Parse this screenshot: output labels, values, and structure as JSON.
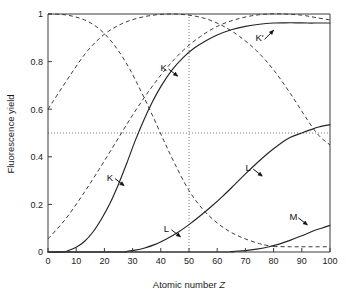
{
  "chart_data": {
    "type": "line",
    "title": "",
    "xlabel": "Atomic number Z",
    "xlabel_plain": "Atomic number",
    "xlabel_italic": "Z",
    "ylabel": "Fluorescence yield",
    "xlim": [
      0,
      100
    ],
    "ylim": [
      0,
      1
    ],
    "grid": false,
    "legend_position": "inline-annotations",
    "xticks": [
      "0",
      "10",
      "20",
      "30",
      "40",
      "50",
      "60",
      "70",
      "80",
      "90",
      "100"
    ],
    "xtick_values": [
      0,
      10,
      20,
      30,
      40,
      50,
      60,
      70,
      80,
      90,
      100
    ],
    "yticks": [
      "0",
      "0.2",
      "0.4",
      "0.6",
      "0.8",
      "1"
    ],
    "ytick_values": [
      0,
      0.2,
      0.4,
      0.6,
      0.8,
      1
    ],
    "reference_lines": [
      {
        "name": "half-yield-line",
        "orientation": "horizontal",
        "value": 0.5,
        "style": "dotted"
      },
      {
        "name": "z50-line",
        "orientation": "vertical",
        "value": 50,
        "style": "dotted"
      }
    ],
    "series": [
      {
        "name": "K fluorescence yield",
        "label": "K",
        "style": "solid",
        "x": [
          0,
          5,
          7,
          10,
          13,
          16,
          19,
          22,
          25,
          28,
          31,
          34,
          37,
          40,
          44,
          48,
          52,
          56,
          60,
          65,
          70,
          75,
          80,
          84,
          88,
          92,
          96,
          100
        ],
        "y": [
          0,
          0.0,
          0.005,
          0.02,
          0.045,
          0.085,
          0.14,
          0.205,
          0.285,
          0.375,
          0.47,
          0.555,
          0.63,
          0.695,
          0.765,
          0.818,
          0.858,
          0.888,
          0.912,
          0.934,
          0.948,
          0.957,
          0.962,
          0.963,
          0.963,
          0.962,
          0.962,
          0.962
        ]
      },
      {
        "name": "L fluorescence yield",
        "label": "L",
        "style": "solid",
        "x": [
          0,
          25,
          28,
          31,
          34,
          38,
          42,
          46,
          50,
          54,
          58,
          62,
          66,
          70,
          74,
          78,
          82,
          86,
          90,
          93,
          96,
          100
        ],
        "y": [
          0,
          0.0,
          0.003,
          0.008,
          0.016,
          0.032,
          0.055,
          0.082,
          0.115,
          0.152,
          0.192,
          0.235,
          0.281,
          0.328,
          0.373,
          0.415,
          0.452,
          0.482,
          0.5,
          0.513,
          0.525,
          0.535
        ]
      },
      {
        "name": "M fluorescence yield",
        "label": "M",
        "style": "solid",
        "x": [
          0,
          60,
          65,
          70,
          74,
          78,
          82,
          86,
          90,
          94,
          97,
          100
        ],
        "y": [
          0,
          0.0,
          0.002,
          0.006,
          0.012,
          0.021,
          0.033,
          0.05,
          0.068,
          0.088,
          0.1,
          0.112
        ]
      },
      {
        "name": "K Auger yield",
        "label": "K'",
        "style": "dashed",
        "x": [
          0,
          5,
          9,
          13,
          17,
          21,
          25,
          29,
          33,
          37,
          41,
          45,
          50,
          55,
          60,
          65,
          70,
          75,
          78,
          80
        ],
        "y": [
          1.0,
          0.998,
          0.99,
          0.975,
          0.948,
          0.905,
          0.845,
          0.768,
          0.675,
          0.575,
          0.47,
          0.37,
          0.258,
          0.178,
          0.122,
          0.082,
          0.055,
          0.035,
          0.027,
          0.023
        ]
      },
      {
        "name": "M Auger-like yield high-Z tail",
        "label": "",
        "style": "dashed",
        "x": [
          80,
          86,
          92,
          100
        ],
        "y": [
          0.023,
          0.022,
          0.022,
          0.022
        ]
      },
      {
        "name": "L Auger yield",
        "label": "",
        "style": "dashed",
        "x": [
          0,
          8,
          14,
          20,
          26,
          32,
          38,
          44,
          50,
          56,
          62,
          68,
          74,
          80,
          86,
          92,
          96,
          100
        ],
        "y": [
          0.6,
          0.745,
          0.845,
          0.915,
          0.958,
          0.983,
          0.996,
          1.0,
          0.995,
          0.98,
          0.95,
          0.905,
          0.845,
          0.765,
          0.665,
          0.555,
          0.49,
          0.45
        ]
      },
      {
        "name": "M Auger yield",
        "label": "",
        "style": "dashed",
        "x": [
          0,
          6,
          12,
          18,
          24,
          30,
          36,
          42,
          48,
          54,
          60,
          66,
          72,
          78,
          84,
          90,
          95,
          100
        ],
        "y": [
          0.055,
          0.135,
          0.235,
          0.345,
          0.46,
          0.575,
          0.68,
          0.772,
          0.848,
          0.905,
          0.948,
          0.975,
          0.992,
          1.0,
          1.0,
          0.995,
          0.985,
          0.975
        ]
      }
    ],
    "annotations": [
      {
        "name": "k-solid-lower-label",
        "text": "K",
        "x": 22,
        "y": 0.3,
        "points_to": "K fluorescence yield"
      },
      {
        "name": "k-solid-upper-label",
        "text": "K",
        "x": 41,
        "y": 0.76,
        "points_to": "K fluorescence yield"
      },
      {
        "name": "k-prime-label",
        "text": "K'",
        "x": 75,
        "y": 0.885,
        "points_to": "K fluorescence yield"
      },
      {
        "name": "l-solid-lower-label",
        "text": "L",
        "x": 42,
        "y": 0.085,
        "points_to": "L fluorescence yield"
      },
      {
        "name": "l-solid-upper-label",
        "text": "L",
        "x": 71,
        "y": 0.34,
        "points_to": "L fluorescence yield"
      },
      {
        "name": "m-solid-label",
        "text": "M",
        "x": 87,
        "y": 0.135,
        "points_to": "M fluorescence yield"
      }
    ],
    "colors": {
      "solid_curve": "#242424",
      "dashed_curve": "#3c3c3c",
      "reference_line": "#6b6b6b",
      "axis": "#3a3a3a",
      "text": "#1a1a1a",
      "background": "#ffffff"
    }
  }
}
